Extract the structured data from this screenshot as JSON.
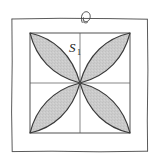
{
  "figure": {
    "kind": "four-petal-rosette-in-square",
    "caption_label": "S",
    "caption_subscript": "1",
    "region_label": "S1",
    "background_color": "#ffffff",
    "outer_frame": {
      "name": "hand-drawn-border",
      "stroke_color": "#555555",
      "stroke_width": 1,
      "x": 11,
      "y": 18,
      "width": 137,
      "height": 134
    },
    "top_knot": {
      "name": "loop-knot-ornament",
      "stroke_color": "#4a4a4a",
      "center_x": 85,
      "center_y": 17,
      "radius": 5
    },
    "inner_square": {
      "name": "plot-square",
      "stroke_color": "#4a4a4a",
      "stroke_width": 1,
      "x": 30,
      "y": 33,
      "size": 100
    },
    "gridlines": {
      "name": "quadrant-axes",
      "stroke_color": "#9a9a9a",
      "stroke_width": 1,
      "vertical_x": 80,
      "horizontal_y": 83
    },
    "petals": {
      "count": 4,
      "fill_color": "#c9c9c9",
      "stroke_color": "#3a3a3a",
      "stroke_width": 1.1,
      "center_x": 80,
      "center_y": 83,
      "items": [
        {
          "name": "petal-upper-left",
          "corner_x": 30,
          "corner_y": 33
        },
        {
          "name": "petal-upper-right",
          "corner_x": 130,
          "corner_y": 33
        },
        {
          "name": "petal-lower-right",
          "corner_x": 130,
          "corner_y": 133
        },
        {
          "name": "petal-lower-left",
          "corner_x": 30,
          "corner_y": 133
        }
      ]
    },
    "label_position": {
      "x": 69,
      "y": 52
    }
  }
}
